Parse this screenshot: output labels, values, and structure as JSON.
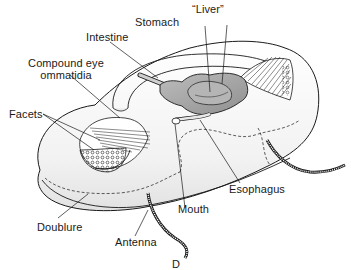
{
  "figure": {
    "panel_letter": "D"
  },
  "labels": {
    "stomach": "Stomach",
    "liver": "“Liver”",
    "intestine": "Intestine",
    "compound_eye_line1": "Compound eye",
    "compound_eye_line2": "ommatidia",
    "facets": "Facets",
    "esophagus": "Esophagus",
    "mouth": "Mouth",
    "doublure": "Doublure",
    "antenna": "Antenna"
  },
  "colors": {
    "line": "#1a1a1a",
    "organ_fill": "#a9a9a9",
    "body_shade": "#e6e6e6",
    "background": "#ffffff"
  }
}
